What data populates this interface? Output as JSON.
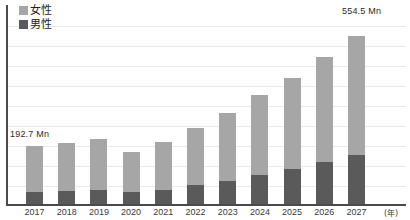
{
  "legend": {
    "position": "top-left",
    "items": [
      {
        "label": "女性",
        "color": "#a6a6a6",
        "swatch_name": "legend-swatch-female"
      },
      {
        "label": "男性",
        "color": "#5a5a5a",
        "swatch_name": "legend-swatch-male"
      }
    ]
  },
  "annotations": {
    "first_value": "192.7 Mn",
    "last_value": "554.5 Mn"
  },
  "axis": {
    "x_unit": "(年)"
  },
  "chart_data": {
    "type": "bar",
    "stacked": true,
    "title": "",
    "subtitle": "",
    "xlabel": "(年)",
    "ylabel": "",
    "grid": true,
    "gridlines_y": [
      0,
      62,
      124,
      186,
      248,
      310,
      372,
      434,
      496,
      558
    ],
    "ylim": [
      0,
      620
    ],
    "categories": [
      "2017",
      "2018",
      "2019",
      "2020",
      "2021",
      "2022",
      "2023",
      "2024",
      "2025",
      "2026",
      "2027"
    ],
    "series": [
      {
        "name": "男性",
        "color": "#5a5a5a",
        "values": [
          38.5,
          44.0,
          47.5,
          38.5,
          46.5,
          62.0,
          74.5,
          96.0,
          114.0,
          140.0,
          163.0
        ]
      },
      {
        "name": "女性",
        "color": "#a6a6a6",
        "values": [
          154.2,
          158.0,
          166.5,
          134.5,
          158.5,
          190.0,
          226.5,
          265.0,
          300.0,
          344.0,
          391.5
        ]
      }
    ],
    "totals": [
      192.7,
      202.0,
      214.0,
      173.0,
      205.0,
      252.0,
      301.0,
      361.0,
      414.0,
      484.0,
      554.5
    ],
    "annotations": [
      {
        "category": "2017",
        "text": "192.7 Mn"
      },
      {
        "category": "2027",
        "text": "554.5 Mn"
      }
    ],
    "legend_entries": [
      "女性",
      "男性"
    ]
  }
}
